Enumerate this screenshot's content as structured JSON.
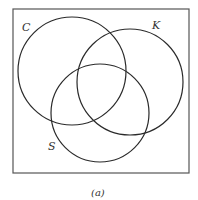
{
  "diagram": {
    "type": "venn",
    "caption": "(a)",
    "universe": {
      "x": 13,
      "y": 9,
      "w": 176,
      "h": 164
    },
    "sets": [
      {
        "label": "C",
        "cx": 72,
        "cy": 71,
        "r": 54,
        "label_x": 23,
        "label_y": 31
      },
      {
        "label": "K",
        "cx": 130,
        "cy": 82,
        "r": 53,
        "label_x": 153,
        "label_y": 28
      },
      {
        "label": "S",
        "cx": 100,
        "cy": 113,
        "r": 49,
        "label_x": 48,
        "label_y": 150
      }
    ],
    "stroke_color": "#2a2a2a",
    "frame_color": "#555555"
  }
}
